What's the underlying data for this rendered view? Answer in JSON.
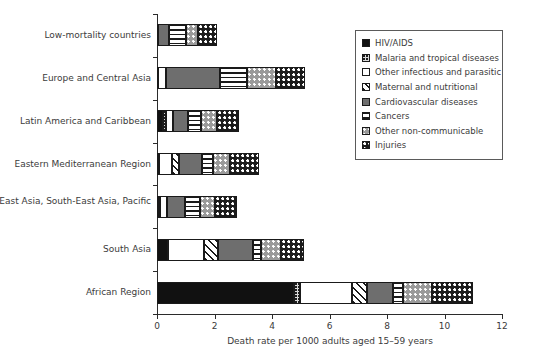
{
  "chart_data": {
    "type": "bar",
    "orientation": "horizontal",
    "stacked": true,
    "title": "",
    "xlabel": "Death rate per 1000 adults aged 15–59 years",
    "ylabel": "",
    "xlim": [
      0,
      12
    ],
    "xticks": [
      0,
      2,
      4,
      6,
      8,
      10,
      12
    ],
    "xticklabels": [
      "0",
      "2",
      "4",
      "6",
      "8",
      "10",
      "12"
    ],
    "grid": false,
    "legend_position": "upper right",
    "categories": [
      "Low-mortality countries",
      "Europe and Central Asia",
      "Latin America and Caribbean",
      "Eastern Mediterranean Region",
      "East Asia, South-East Asia, Pacific",
      "South Asia",
      "African Region"
    ],
    "series": [
      {
        "name": "HIV/AIDS",
        "key": "hiv",
        "pattern": "solid-black",
        "color": "#111111",
        "values": [
          0.02,
          0.03,
          0.22,
          0.05,
          0.05,
          0.38,
          4.75
        ]
      },
      {
        "name": "Malaria and tropical diseases",
        "key": "malaria",
        "pattern": "fine-dots-on-light-gray",
        "color": "#d8d8d8",
        "values": [
          0.0,
          0.0,
          0.1,
          0.03,
          0.06,
          0.0,
          0.22
        ]
      },
      {
        "name": "Other infectious and parasitic",
        "key": "other_infectious",
        "pattern": "white",
        "color": "#ffffff",
        "values": [
          0.0,
          0.3,
          0.23,
          0.45,
          0.25,
          1.25,
          1.8
        ]
      },
      {
        "name": "Maternal and nutritional",
        "key": "maternal",
        "pattern": "diagonal-hatch",
        "color": "#f2f2f2",
        "values": [
          0.0,
          0.0,
          0.0,
          0.22,
          0.0,
          0.5,
          0.55
        ]
      },
      {
        "name": "Cardiovascular diseases",
        "key": "cardiovascular",
        "pattern": "solid-gray",
        "color": "#6e6e6e",
        "values": [
          0.4,
          1.85,
          0.52,
          0.8,
          0.6,
          1.2,
          0.9
        ]
      },
      {
        "name": "Cancers",
        "key": "cancers",
        "pattern": "horizontal-stripes",
        "color": "#ffffff",
        "values": [
          0.6,
          0.95,
          0.45,
          0.4,
          0.55,
          0.3,
          0.35
        ]
      },
      {
        "name": "Other non-communicable",
        "key": "other_noncommunicable",
        "pattern": "white-dots-on-gray",
        "color": "#9a9a9a",
        "values": [
          0.4,
          1.0,
          0.55,
          0.6,
          0.5,
          0.7,
          1.0
        ]
      },
      {
        "name": "Injuries",
        "key": "injuries",
        "pattern": "white-dots-on-black",
        "color": "#1a1a1a",
        "values": [
          0.68,
          1.02,
          0.78,
          1.0,
          0.79,
          0.77,
          1.43
        ]
      }
    ],
    "totals": [
      2.1,
      5.15,
      2.85,
      3.55,
      2.8,
      5.1,
      11.0
    ]
  },
  "legend": {
    "items": [
      {
        "label": "HIV/AIDS",
        "key": "hiv"
      },
      {
        "label": "Malaria and tropical diseases",
        "key": "malaria"
      },
      {
        "label": "Other infectious and parasitic",
        "key": "other_infectious"
      },
      {
        "label": "Maternal and nutritional",
        "key": "maternal"
      },
      {
        "label": "Cardiovascular diseases",
        "key": "cardiovascular"
      },
      {
        "label": "Cancers",
        "key": "cancers"
      },
      {
        "label": "Other non-communicable",
        "key": "other_noncommunicable"
      },
      {
        "label": "Injuries",
        "key": "injuries"
      }
    ]
  }
}
